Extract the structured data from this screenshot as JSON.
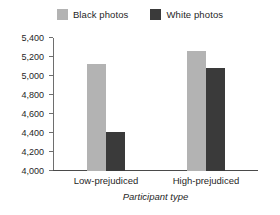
{
  "chart_data": {
    "type": "bar",
    "title": "",
    "subtitle": "",
    "categories": [
      "Low-prejudiced",
      "High-prejudiced"
    ],
    "series": [
      {
        "name": "Black photos",
        "values": [
          5130,
          5260
        ],
        "color": "#b3b3b3"
      },
      {
        "name": "White photos",
        "values": [
          4415,
          5080
        ],
        "color": "#3a3a3a"
      }
    ],
    "xlabel": "Participant type",
    "ylabel": "Reaction time (ms)",
    "ylim": [
      4000,
      5400
    ],
    "ytick_step": 200,
    "ytick_labels": [
      "5,400",
      "5,200",
      "5,000",
      "4,800",
      "4,600",
      "4,400",
      "4,200",
      "4,000"
    ],
    "ytick_values": [
      5400,
      5200,
      5000,
      4800,
      4600,
      4400,
      4200,
      4000
    ],
    "grid": false,
    "legend_position": "top-center",
    "background_color": "#ffffff",
    "axis_color": "#6e6e6e",
    "baseline_color": "#4a4a4a"
  }
}
